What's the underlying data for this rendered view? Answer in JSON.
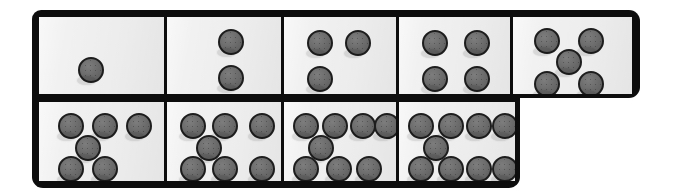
{
  "figure": {
    "kind": "domino-tile-strip",
    "background_color": "#ffffff",
    "frame_color": "#0d0d0d",
    "tile_face_color": "#f1f1f1",
    "pip_fill_color": "#6e6e6e",
    "pip_outline_color": "#1d1d1d",
    "total_tiles": 9,
    "pip_diameter_px": 26
  },
  "rows": [
    {
      "name": "top-row",
      "x": 32,
      "y": 10,
      "width": 608,
      "height": 88,
      "tiles": [
        {
          "label": "tile-1",
          "pip_count": 1,
          "width": 125,
          "arrangement": "single-center",
          "pips": [
            {
              "x": 52,
              "y": 53
            }
          ]
        },
        {
          "label": "tile-2",
          "pip_count": 2,
          "width": 117,
          "arrangement": "vertical-pair",
          "pips": [
            {
              "x": 64,
              "y": 25
            },
            {
              "x": 64,
              "y": 61
            }
          ]
        },
        {
          "label": "tile-3",
          "pip_count": 3,
          "width": 115,
          "arrangement": "two-top-one-bottom-left",
          "pips": [
            {
              "x": 36,
              "y": 26
            },
            {
              "x": 74,
              "y": 26
            },
            {
              "x": 36,
              "y": 62
            }
          ]
        },
        {
          "label": "tile-4",
          "pip_count": 4,
          "width": 114,
          "arrangement": "square-four",
          "pips": [
            {
              "x": 36,
              "y": 26
            },
            {
              "x": 78,
              "y": 26
            },
            {
              "x": 36,
              "y": 62
            },
            {
              "x": 78,
              "y": 62
            }
          ]
        },
        {
          "label": "tile-5",
          "pip_count": 5,
          "width": 122,
          "arrangement": "quincunx-five",
          "pips": [
            {
              "x": 34,
              "y": 24
            },
            {
              "x": 78,
              "y": 24
            },
            {
              "x": 56,
              "y": 45
            },
            {
              "x": 34,
              "y": 67
            },
            {
              "x": 78,
              "y": 67
            }
          ]
        }
      ]
    },
    {
      "name": "bottom-row",
      "x": 32,
      "y": 98,
      "width": 488,
      "height": 90,
      "tiles": [
        {
          "label": "tile-6",
          "pip_count": 6,
          "width": 125,
          "arrangement": "five-plus-one-right",
          "pips": [
            {
              "x": 32,
              "y": 24
            },
            {
              "x": 66,
              "y": 24
            },
            {
              "x": 100,
              "y": 24
            },
            {
              "x": 49,
              "y": 46
            },
            {
              "x": 32,
              "y": 67
            },
            {
              "x": 66,
              "y": 67
            }
          ]
        },
        {
          "label": "tile-7",
          "pip_count": 7,
          "width": 117,
          "arrangement": "three-one-three",
          "pips": [
            {
              "x": 26,
              "y": 24
            },
            {
              "x": 58,
              "y": 24
            },
            {
              "x": 95,
              "y": 24
            },
            {
              "x": 42,
              "y": 46
            },
            {
              "x": 26,
              "y": 67
            },
            {
              "x": 58,
              "y": 67
            },
            {
              "x": 95,
              "y": 67
            }
          ]
        },
        {
          "label": "tile-8",
          "pip_count": 8,
          "width": 115,
          "arrangement": "four-one-three",
          "pips": [
            {
              "x": 22,
              "y": 24
            },
            {
              "x": 51,
              "y": 24
            },
            {
              "x": 79,
              "y": 24
            },
            {
              "x": 103,
              "y": 24
            },
            {
              "x": 37,
              "y": 46
            },
            {
              "x": 22,
              "y": 67
            },
            {
              "x": 55,
              "y": 67
            },
            {
              "x": 85,
              "y": 67
            }
          ]
        },
        {
          "label": "tile-9",
          "pip_count": 9,
          "width": 119,
          "arrangement": "four-one-four",
          "pips": [
            {
              "x": 22,
              "y": 24
            },
            {
              "x": 52,
              "y": 24
            },
            {
              "x": 80,
              "y": 24
            },
            {
              "x": 106,
              "y": 24
            },
            {
              "x": 37,
              "y": 46
            },
            {
              "x": 22,
              "y": 67
            },
            {
              "x": 52,
              "y": 67
            },
            {
              "x": 80,
              "y": 67
            },
            {
              "x": 106,
              "y": 67
            }
          ]
        }
      ]
    }
  ]
}
